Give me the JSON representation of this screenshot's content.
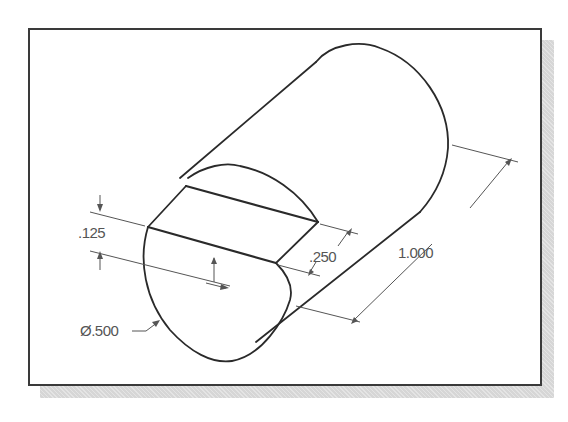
{
  "figure": {
    "type": "isometric cylinder with flat cut",
    "colors": {
      "outline": "#2a2a2a",
      "dimension": "#555555",
      "frame": "#3a3a3a",
      "shadow": "#d6d6d6"
    }
  },
  "dimensions": {
    "flat_depth": ".125",
    "flat_length": ".250",
    "overall_length": "1.000",
    "diameter": "Ø.500"
  }
}
